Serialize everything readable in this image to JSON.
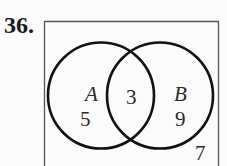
{
  "problem_number": "36.",
  "diagram": {
    "type": "venn",
    "sets": [
      {
        "name": "A",
        "only_count": "5"
      },
      {
        "name": "B",
        "only_count": "9"
      }
    ],
    "intersection_count": "3",
    "outside_count": "7"
  }
}
